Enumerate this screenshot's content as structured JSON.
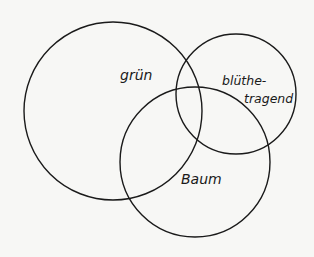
{
  "diagram": {
    "type": "venn",
    "stroke_color": "#1a1a1a",
    "background": "#f7f7f5",
    "sets": [
      {
        "id": "gruen",
        "label": "grün",
        "cx": 113,
        "cy": 111,
        "r": 90
      },
      {
        "id": "bluethetragend",
        "label_line1": "blüthe-",
        "label_line2": "tragend",
        "cx": 236,
        "cy": 94,
        "r": 61
      },
      {
        "id": "baum",
        "label": "Baum",
        "cx": 195,
        "cy": 162,
        "r": 75
      }
    ]
  }
}
